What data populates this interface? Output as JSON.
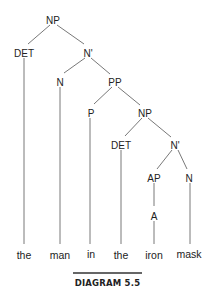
{
  "diagram": {
    "type": "syntax-tree",
    "caption": "DIAGRAM 5.5",
    "colors": {
      "text": "#222222",
      "edge": "#555555",
      "caption_rule": "#333333"
    },
    "nodes": [
      {
        "id": "np_root",
        "label": "NP",
        "x": 53,
        "y": 20
      },
      {
        "id": "det_1",
        "label": "DET",
        "x": 24,
        "y": 53
      },
      {
        "id": "nbar_1",
        "label": "N'",
        "x": 88,
        "y": 53
      },
      {
        "id": "n_1",
        "label": "N",
        "x": 60,
        "y": 82
      },
      {
        "id": "pp",
        "label": "PP",
        "x": 115,
        "y": 82
      },
      {
        "id": "p",
        "label": "P",
        "x": 91,
        "y": 113
      },
      {
        "id": "np_2",
        "label": "NP",
        "x": 145,
        "y": 113
      },
      {
        "id": "det_2",
        "label": "DET",
        "x": 121,
        "y": 145
      },
      {
        "id": "nbar_2",
        "label": "N'",
        "x": 175,
        "y": 145
      },
      {
        "id": "ap",
        "label": "AP",
        "x": 154,
        "y": 178
      },
      {
        "id": "n_2",
        "label": "N",
        "x": 189,
        "y": 178
      },
      {
        "id": "a",
        "label": "A",
        "x": 154,
        "y": 216
      }
    ],
    "words": [
      {
        "id": "w_the_1",
        "label": "the",
        "x": 24,
        "y": 255
      },
      {
        "id": "w_man",
        "label": "man",
        "x": 60,
        "y": 255
      },
      {
        "id": "w_in",
        "label": "in",
        "x": 91,
        "y": 254
      },
      {
        "id": "w_the_2",
        "label": "the",
        "x": 121,
        "y": 255
      },
      {
        "id": "w_iron",
        "label": "iron",
        "x": 154,
        "y": 255
      },
      {
        "id": "w_mask",
        "label": "mask",
        "x": 189,
        "y": 254
      }
    ],
    "edges": [
      {
        "from": "np_root",
        "to": "det_1",
        "x1": 50,
        "y1": 25,
        "x2": 28,
        "y2": 44
      },
      {
        "from": "np_root",
        "to": "nbar_1",
        "x1": 57,
        "y1": 25,
        "x2": 84,
        "y2": 44
      },
      {
        "from": "nbar_1",
        "to": "n_1",
        "x1": 85,
        "y1": 58,
        "x2": 64,
        "y2": 73
      },
      {
        "from": "nbar_1",
        "to": "pp",
        "x1": 91,
        "y1": 58,
        "x2": 110,
        "y2": 74
      },
      {
        "from": "pp",
        "to": "p",
        "x1": 112,
        "y1": 87,
        "x2": 94,
        "y2": 104
      },
      {
        "from": "pp",
        "to": "np_2",
        "x1": 118,
        "y1": 87,
        "x2": 140,
        "y2": 105
      },
      {
        "from": "np_2",
        "to": "det_2",
        "x1": 142,
        "y1": 118,
        "x2": 125,
        "y2": 136
      },
      {
        "from": "np_2",
        "to": "nbar_2",
        "x1": 148,
        "y1": 118,
        "x2": 171,
        "y2": 137
      },
      {
        "from": "nbar_2",
        "to": "ap",
        "x1": 172,
        "y1": 150,
        "x2": 157,
        "y2": 169
      },
      {
        "from": "nbar_2",
        "to": "n_2",
        "x1": 178,
        "y1": 150,
        "x2": 187,
        "y2": 169
      },
      {
        "from": "ap",
        "to": "a",
        "x1": 154,
        "y1": 183,
        "x2": 154,
        "y2": 206
      },
      {
        "from": "det_1",
        "to": "w_the_1",
        "x1": 24,
        "y1": 58,
        "x2": 24,
        "y2": 244
      },
      {
        "from": "n_1",
        "to": "w_man",
        "x1": 60,
        "y1": 87,
        "x2": 60,
        "y2": 244
      },
      {
        "from": "p",
        "to": "w_in",
        "x1": 90,
        "y1": 118,
        "x2": 90,
        "y2": 244
      },
      {
        "from": "det_2",
        "to": "w_the_2",
        "x1": 121,
        "y1": 150,
        "x2": 121,
        "y2": 244
      },
      {
        "from": "a",
        "to": "w_iron",
        "x1": 154,
        "y1": 221,
        "x2": 154,
        "y2": 244
      },
      {
        "from": "n_2",
        "to": "w_mask",
        "x1": 190,
        "y1": 183,
        "x2": 190,
        "y2": 244
      }
    ],
    "caption_rule": {
      "x1": 73,
      "y1": 273,
      "x2": 142,
      "y2": 273
    },
    "caption_pos": {
      "x": 107.5,
      "y": 286
    }
  }
}
